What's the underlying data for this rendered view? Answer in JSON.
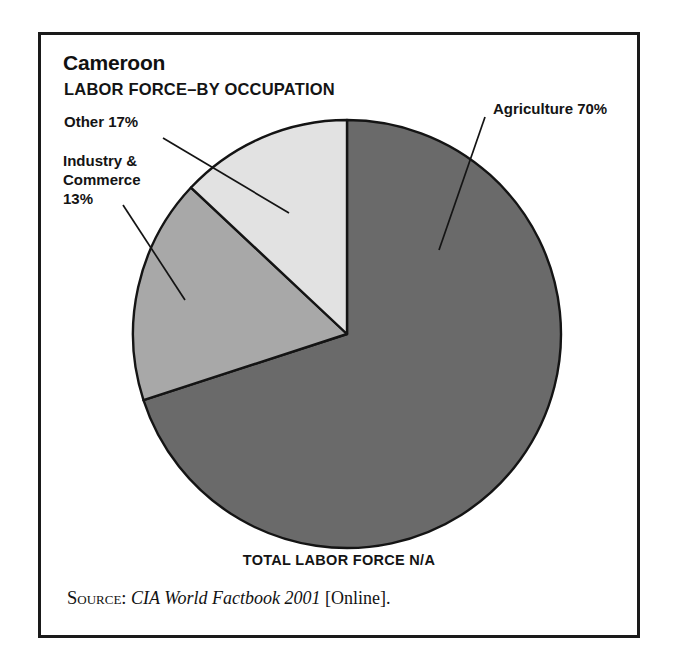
{
  "figure": {
    "country_title": "Cameroon",
    "subtitle": "LABOR FORCE–BY OCCUPATION",
    "total_caption": "TOTAL LABOR FORCE N/A",
    "source": {
      "keyword": "Source:",
      "title": "CIA World Factbook 2001",
      "suffix": "[Online]."
    },
    "labels": {
      "other": "Other 17%",
      "industry": "Industry &\nCommerce\n13%",
      "agriculture": "Agriculture 70%"
    }
  },
  "colors": {
    "frame": "#1a1a1a",
    "agriculture": "#6a6a6a",
    "other": "#a8a8a8",
    "industry": "#e2e2e2",
    "slice_outline": "#141414",
    "leader_line": "#141414",
    "background": "#ffffff"
  },
  "chart_data": {
    "type": "pie",
    "title": "Cameroon LABOR FORCE–BY OCCUPATION",
    "subtitle": "LABOR FORCE–BY OCCUPATION",
    "annotations": [
      "TOTAL LABOR FORCE N/A"
    ],
    "legend_position": "none",
    "grid": false,
    "unit": "percent",
    "start_angle_deg": 0,
    "direction": "clockwise",
    "categories": [
      "Agriculture",
      "Other",
      "Industry & Commerce"
    ],
    "values": [
      70,
      17,
      13
    ],
    "labels": [
      "Agriculture 70%",
      "Other 17%",
      "Industry & Commerce 13%"
    ],
    "colors": [
      "#6a6a6a",
      "#a8a8a8",
      "#e2e2e2"
    ],
    "slices": [
      {
        "name": "Agriculture",
        "value": 70,
        "label": "Agriculture 70%",
        "color": "#6a6a6a"
      },
      {
        "name": "Other",
        "value": 17,
        "label": "Other 17%",
        "color": "#a8a8a8"
      },
      {
        "name": "Industry & Commerce",
        "value": 13,
        "label": "Industry & Commerce 13%",
        "color": "#e2e2e2"
      }
    ]
  }
}
